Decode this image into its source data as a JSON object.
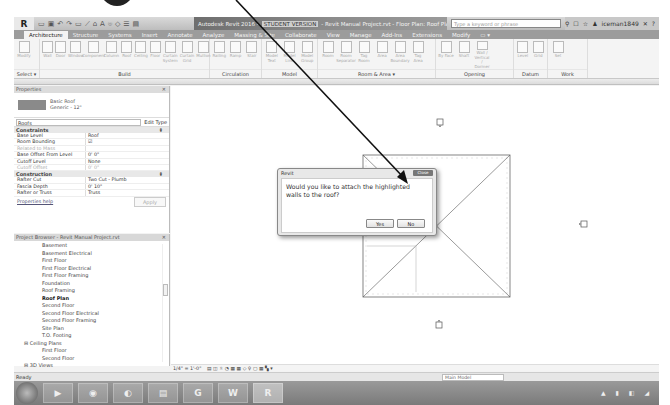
{
  "titlebar": {
    "app_button": "R",
    "qat_icons": [
      "open-icon",
      "save-icon",
      "undo-icon",
      "redo-icon",
      "print-icon",
      "measure-icon",
      "tag-icon",
      "text-icon",
      "3d-view-icon",
      "section-icon",
      "thin-lines-icon",
      "switch-windows-icon"
    ],
    "title_prefix": "Autodesk Revit 2016 -",
    "student_version": "STUDENT VERSION",
    "title_suffix": "- Revit Manual Project.rvt - Floor Plan: Roof Plan",
    "search_placeholder": "Type a keyword or phrase",
    "user": "iceman1849",
    "help": "?"
  },
  "tabs": [
    {
      "label": "Architecture",
      "active": true
    },
    {
      "label": "Structure"
    },
    {
      "label": "Systems"
    },
    {
      "label": "Insert"
    },
    {
      "label": "Annotate"
    },
    {
      "label": "Analyze"
    },
    {
      "label": "Massing & Site"
    },
    {
      "label": "Collaborate"
    },
    {
      "label": "View"
    },
    {
      "label": "Manage"
    },
    {
      "label": "Add-Ins"
    },
    {
      "label": "Extensions"
    },
    {
      "label": "Modify"
    },
    {
      "label": "▭ ▾"
    }
  ],
  "ribbon": {
    "panels": [
      {
        "label": "Select ▾",
        "tools": [
          "Modify"
        ]
      },
      {
        "label": "Build",
        "tools": [
          "Wall",
          "Door",
          "Window",
          "Component",
          "Column",
          "Roof",
          "Ceiling",
          "Floor",
          "Curtain System",
          "Curtain Grid",
          "Mullion"
        ]
      },
      {
        "label": "Circulation",
        "tools": [
          "Railing",
          "Ramp",
          "Stair"
        ]
      },
      {
        "label": "Model",
        "tools": [
          "Model Text",
          "Model Line",
          "Model Group"
        ]
      },
      {
        "label": "Room & Area ▾",
        "tools": [
          "Room",
          "Room Separator",
          "Tag Room",
          "Area",
          "Area Boundary",
          "Tag Area"
        ]
      },
      {
        "label": "Opening",
        "tools": [
          "By Face",
          "Shaft",
          "Wall / Vertical / Dormer"
        ]
      },
      {
        "label": "Datum",
        "tools": [
          "Level",
          "Grid"
        ]
      },
      {
        "label": "Work",
        "tools": [
          "Set"
        ]
      }
    ]
  },
  "properties": {
    "header": "Properties",
    "type_name": "Basic Roof",
    "type_sub": "Generic - 12\"",
    "category": "Roofs",
    "edit_type": "Edit Type",
    "groups": [
      {
        "name": "Constraints",
        "rows": [
          {
            "k": "Base Level",
            "v": "Roof"
          },
          {
            "k": "Room Bounding",
            "v": "☑"
          },
          {
            "k": "Related to Mass",
            "v": "",
            "dim": true
          },
          {
            "k": "Base Offset From Level",
            "v": "0' 0\""
          },
          {
            "k": "Cutoff Level",
            "v": "None"
          },
          {
            "k": "Cutoff Offset",
            "v": "0' 0\"",
            "dim": true
          }
        ]
      },
      {
        "name": "Construction",
        "rows": [
          {
            "k": "Rafter Cut",
            "v": "Two Cut - Plumb"
          },
          {
            "k": "Fascia Depth",
            "v": "0' 10\""
          },
          {
            "k": "Rafter or Truss",
            "v": "Truss"
          }
        ]
      }
    ],
    "help_link": "Properties help",
    "apply": "Apply"
  },
  "browser": {
    "header": "Project Browser - Revit Manual Project.rvt",
    "items": [
      {
        "label": "Basement",
        "level": 2
      },
      {
        "label": "Basement Electrical",
        "level": 2
      },
      {
        "label": "First Floor",
        "level": 2
      },
      {
        "label": "First Floor Electrical",
        "level": 2
      },
      {
        "label": "First Floor Framing",
        "level": 2
      },
      {
        "label": "Foundation",
        "level": 2
      },
      {
        "label": "Roof Framing",
        "level": 2
      },
      {
        "label": "Roof Plan",
        "level": 2,
        "bold": true
      },
      {
        "label": "Second Floor",
        "level": 2
      },
      {
        "label": "Second Floor Electrical",
        "level": 2
      },
      {
        "label": "Second Floor Framing",
        "level": 2
      },
      {
        "label": "Site Plan",
        "level": 2
      },
      {
        "label": "T.O. Footing",
        "level": 2
      },
      {
        "label": "⊟ Ceiling Plans",
        "level": 1
      },
      {
        "label": "First Floor",
        "level": 2
      },
      {
        "label": "Second Floor",
        "level": 2
      },
      {
        "label": "⊟ 3D Views",
        "level": 1
      }
    ]
  },
  "dialog": {
    "title": "Revit",
    "close": "Close",
    "message": "Would you like to attach the highlighted walls to the roof?",
    "yes": "Yes",
    "no": "No"
  },
  "view_bar": {
    "scale": "1/4\" = 1'-0\"",
    "icons": "▤ ◫ ☼ ◔ ▦ ▦ ◇ ♀ ▢ ▦ ▚ ▾"
  },
  "status": {
    "text": "Ready",
    "model": "Main Model"
  },
  "taskbar": {
    "items": [
      {
        "label": "▶",
        "name": "media-player"
      },
      {
        "label": "◉",
        "name": "chrome"
      },
      {
        "label": "◐",
        "name": "app-3"
      },
      {
        "label": "▤",
        "name": "file-explorer"
      },
      {
        "label": "G",
        "name": "app-g"
      },
      {
        "label": "W",
        "name": "word"
      },
      {
        "label": "R",
        "name": "revit",
        "active": true
      }
    ],
    "tray": "▲ ▮ ◧ ◢"
  }
}
